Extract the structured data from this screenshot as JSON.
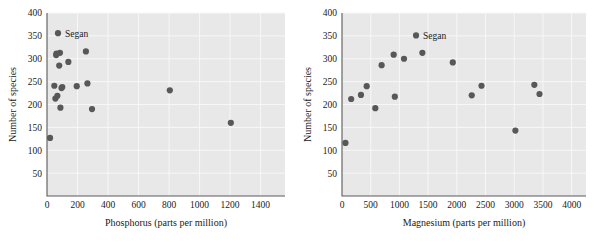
{
  "figure": {
    "background": "#ffffff",
    "point_color": "#585858",
    "plot_background": "#e8e8e8",
    "gridline_color": "#f7f7f7",
    "axis_color": "#5a5a5a"
  },
  "chart_data": [
    {
      "type": "scatter",
      "panel": "left",
      "title": "",
      "xlabel": "Phosphorus (parts per million)",
      "ylabel": "Number of species",
      "xlim": [
        0,
        1560
      ],
      "ylim": [
        0,
        400
      ],
      "xticks": [
        0,
        200,
        400,
        600,
        800,
        1000,
        1200,
        1400
      ],
      "yticks": [
        50,
        100,
        150,
        200,
        250,
        300,
        350,
        400
      ],
      "xticklabels": [
        "0",
        "200",
        "400",
        "600",
        "800",
        "1000",
        "1200",
        "1400"
      ],
      "yticklabels": [
        "50",
        "100",
        "150",
        "200",
        "250",
        "300",
        "350",
        "400"
      ],
      "grid": true,
      "legend": "none",
      "x": [
        20,
        48,
        55,
        60,
        62,
        68,
        72,
        80,
        85,
        88,
        95,
        100,
        140,
        195,
        255,
        265,
        295,
        805,
        1205
      ],
      "y": [
        127,
        241,
        213,
        308,
        311,
        219,
        356,
        285,
        313,
        193,
        236,
        238,
        293,
        240,
        316,
        246,
        190,
        231,
        160
      ],
      "annotations": [
        {
          "label": "Segan",
          "x": 72,
          "y": 356
        }
      ]
    },
    {
      "type": "scatter",
      "panel": "right",
      "title": "",
      "xlabel": "Magnesium (parts per million)",
      "ylabel": "Number of species",
      "xlim": [
        0,
        4250
      ],
      "ylim": [
        0,
        400
      ],
      "xticks": [
        0,
        500,
        1000,
        1500,
        2000,
        2500,
        3000,
        3500,
        4000
      ],
      "yticks": [
        50,
        100,
        150,
        200,
        250,
        300,
        350,
        400
      ],
      "xticklabels": [
        "0",
        "500",
        "1000",
        "1500",
        "2000",
        "2500",
        "3000",
        "3500",
        "4000"
      ],
      "yticklabels": [
        "50",
        "100",
        "150",
        "200",
        "250",
        "300",
        "350",
        "400"
      ],
      "grid": true,
      "legend": "none",
      "x": [
        60,
        160,
        330,
        430,
        580,
        690,
        900,
        920,
        1080,
        1290,
        1400,
        1930,
        2260,
        2430,
        3020,
        3350,
        3440
      ],
      "y": [
        116,
        212,
        221,
        240,
        192,
        286,
        309,
        217,
        300,
        351,
        313,
        292,
        220,
        241,
        143,
        243,
        223
      ],
      "annotations": [
        {
          "label": "Segan",
          "x": 1290,
          "y": 351
        }
      ]
    }
  ]
}
